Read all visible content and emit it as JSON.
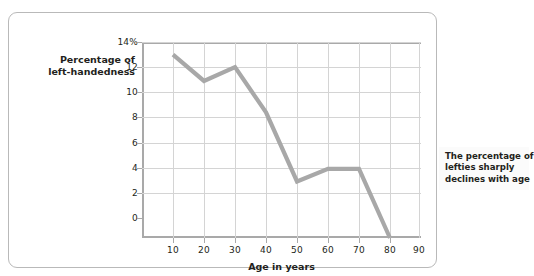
{
  "chart_data": {
    "type": "line",
    "title": "",
    "xlabel": "Age in years",
    "ylabel": "Percentage of left-handedness",
    "ylabel_lines": [
      "Percentage of",
      "left-handedness"
    ],
    "x": [
      10,
      20,
      30,
      40,
      50,
      60,
      70,
      80
    ],
    "values": [
      14.6,
      12.5,
      13.6,
      10.0,
      4.5,
      5.5,
      5.5,
      0.0
    ],
    "series": [
      {
        "name": "Percentage of left-handedness",
        "values": [
          14.6,
          12.5,
          13.6,
          10.0,
          4.5,
          5.5,
          5.5,
          0.0
        ]
      }
    ],
    "xlim": [
      0,
      90
    ],
    "ylim": [
      0,
      15.6
    ],
    "xticks": [
      10,
      20,
      30,
      40,
      50,
      60,
      70,
      80,
      90
    ],
    "xtick_labels": [
      "10",
      "20",
      "30",
      "40",
      "50",
      "60",
      "70",
      "80",
      "90"
    ],
    "yticks": [
      0,
      2,
      4,
      6,
      8,
      10,
      12,
      14
    ],
    "ytick_labels": [
      "0",
      "2",
      "4",
      "6",
      "8",
      "10",
      "12",
      "14%"
    ],
    "grid": true,
    "legend": false,
    "line_color": "#a8a8a8",
    "grid_color": "#d4d4d4",
    "axis_color": "#a9a9a9",
    "text_color": "#231f20",
    "annotations": [
      {
        "id": "decline-callout",
        "lines": [
          "The percentage of",
          "lefties sharply",
          "declines with age"
        ],
        "text": "The percentage of lefties sharply declines with age",
        "background": "#fbfbfb"
      }
    ]
  }
}
